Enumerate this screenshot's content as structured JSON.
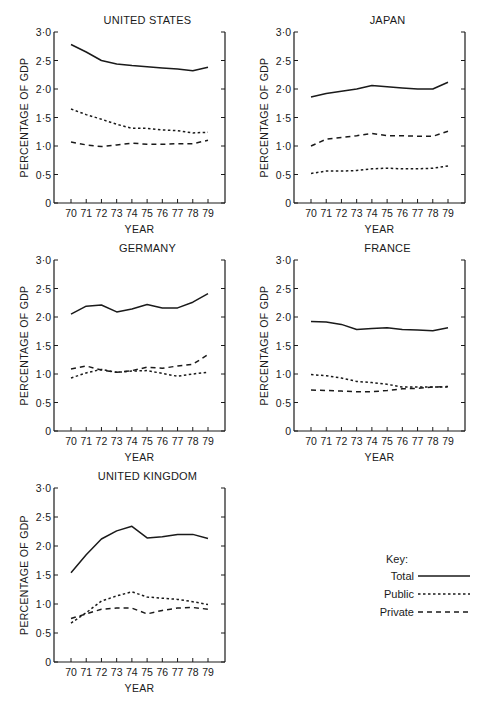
{
  "chart_data": [
    {
      "type": "line",
      "title": "UNITED STATES",
      "xlabel": "YEAR",
      "ylabel": "PERCENTAGE OF GDP",
      "ylim": [
        0,
        3.0
      ],
      "yticks": [
        "0",
        "0·5",
        "1·0",
        "1·5",
        "2·0",
        "2·5",
        "3·0"
      ],
      "categories": [
        "70",
        "71",
        "72",
        "73",
        "74",
        "75",
        "76",
        "77",
        "78",
        "79"
      ],
      "series": [
        {
          "name": "Total",
          "values": [
            2.78,
            2.65,
            2.5,
            2.44,
            2.41,
            2.39,
            2.37,
            2.35,
            2.32,
            2.38
          ]
        },
        {
          "name": "Public",
          "values": [
            1.65,
            1.55,
            1.47,
            1.38,
            1.31,
            1.31,
            1.28,
            1.27,
            1.23,
            1.24
          ]
        },
        {
          "name": "Private",
          "values": [
            1.07,
            1.02,
            0.99,
            1.02,
            1.05,
            1.03,
            1.03,
            1.04,
            1.04,
            1.1
          ]
        }
      ]
    },
    {
      "type": "line",
      "title": "JAPAN",
      "xlabel": "YEAR",
      "ylabel": "PERCENTAGE OF GDP",
      "ylim": [
        0,
        3.0
      ],
      "yticks": [
        "0",
        "0·5",
        "1·0",
        "1·5",
        "2·0",
        "2·5",
        "3·0"
      ],
      "categories": [
        "70",
        "71",
        "72",
        "73",
        "74",
        "75",
        "76",
        "77",
        "78",
        "79"
      ],
      "series": [
        {
          "name": "Total",
          "values": [
            1.86,
            1.92,
            1.96,
            2.0,
            2.06,
            2.04,
            2.02,
            2.0,
            2.0,
            2.12
          ]
        },
        {
          "name": "Public",
          "values": [
            0.52,
            0.56,
            0.56,
            0.57,
            0.6,
            0.61,
            0.6,
            0.6,
            0.61,
            0.65
          ]
        },
        {
          "name": "Private",
          "values": [
            1.0,
            1.12,
            1.15,
            1.18,
            1.22,
            1.18,
            1.18,
            1.17,
            1.17,
            1.26
          ]
        }
      ]
    },
    {
      "type": "line",
      "title": "GERMANY",
      "xlabel": "YEAR",
      "ylabel": "PERCENTAGE OF GDP",
      "ylim": [
        0,
        3.0
      ],
      "yticks": [
        "0",
        "0·5",
        "1·0",
        "1·5",
        "2·0",
        "2·5",
        "3·0"
      ],
      "categories": [
        "70",
        "71",
        "72",
        "73",
        "74",
        "75",
        "76",
        "77",
        "78",
        "79"
      ],
      "series": [
        {
          "name": "Total",
          "values": [
            2.05,
            2.19,
            2.21,
            2.09,
            2.14,
            2.22,
            2.16,
            2.16,
            2.26,
            2.41
          ]
        },
        {
          "name": "Public",
          "values": [
            0.93,
            1.02,
            1.08,
            1.03,
            1.05,
            1.06,
            1.01,
            0.96,
            1.0,
            1.03
          ]
        },
        {
          "name": "Private",
          "values": [
            1.09,
            1.14,
            1.07,
            1.03,
            1.06,
            1.12,
            1.1,
            1.14,
            1.17,
            1.34
          ]
        }
      ]
    },
    {
      "type": "line",
      "title": "FRANCE",
      "xlabel": "YEAR",
      "ylabel": "PERCENTAGE OF GDP",
      "ylim": [
        0,
        3.0
      ],
      "yticks": [
        "0",
        "0·5",
        "1·0",
        "1·5",
        "2·0",
        "2·5",
        "3·0"
      ],
      "categories": [
        "70",
        "71",
        "72",
        "73",
        "74",
        "75",
        "76",
        "77",
        "78",
        "79"
      ],
      "series": [
        {
          "name": "Total",
          "values": [
            1.92,
            1.91,
            1.87,
            1.78,
            1.8,
            1.81,
            1.78,
            1.77,
            1.76,
            1.81
          ]
        },
        {
          "name": "Public",
          "values": [
            0.99,
            0.97,
            0.93,
            0.87,
            0.85,
            0.82,
            0.77,
            0.77,
            0.77,
            0.77
          ]
        },
        {
          "name": "Private",
          "values": [
            0.72,
            0.71,
            0.7,
            0.69,
            0.69,
            0.71,
            0.74,
            0.75,
            0.77,
            0.78
          ]
        }
      ]
    },
    {
      "type": "line",
      "title": "UNITED KINGDOM",
      "xlabel": "YEAR",
      "ylabel": "PERCENTAGE OF GDP",
      "ylim": [
        0,
        3.0
      ],
      "yticks": [
        "0",
        "0·5",
        "1·0",
        "1·5",
        "2·0",
        "2·5",
        "3·0"
      ],
      "categories": [
        "70",
        "71",
        "72",
        "73",
        "74",
        "75",
        "76",
        "77",
        "78",
        "79"
      ],
      "series": [
        {
          "name": "Total",
          "values": [
            1.54,
            1.85,
            2.12,
            2.26,
            2.34,
            2.14,
            2.16,
            2.2,
            2.2,
            2.13
          ]
        },
        {
          "name": "Public",
          "values": [
            0.67,
            0.85,
            1.05,
            1.14,
            1.21,
            1.12,
            1.1,
            1.08,
            1.04,
            0.99
          ]
        },
        {
          "name": "Private",
          "values": [
            0.75,
            0.83,
            0.91,
            0.93,
            0.93,
            0.83,
            0.89,
            0.93,
            0.94,
            0.91
          ]
        }
      ]
    }
  ],
  "legend": {
    "title": "Key:",
    "items": [
      {
        "label": "Total",
        "style": "solid"
      },
      {
        "label": "Public",
        "style": "dotted"
      },
      {
        "label": "Private",
        "style": "dashed"
      }
    ]
  },
  "colors": {
    "ink": "#1a1a1a",
    "background": "#ffffff"
  }
}
